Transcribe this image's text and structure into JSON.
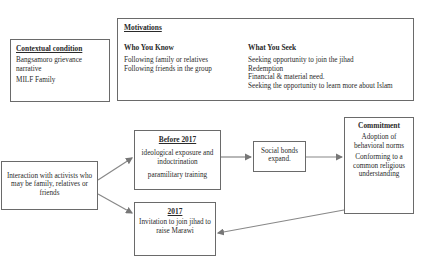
{
  "contextual": {
    "title": "Contextual condition",
    "items": [
      "Bangsamoro grievance narrative",
      "MILF Family"
    ]
  },
  "motivations": {
    "title": "Motivations",
    "who_you_know": {
      "heading": "Who You Know",
      "items": [
        "Following family or relatives",
        "Following friends in the group"
      ]
    },
    "what_you_seek": {
      "heading": "What You Seek",
      "items": [
        "Seeking opportunity to join the jihad",
        "Redemption",
        "Financial & material need.",
        "Seeking the opportunity to learn more about Islam"
      ]
    }
  },
  "interaction": {
    "text": "Interaction with activists who may be family, relatives or friends"
  },
  "before2017": {
    "title": "Before 2017",
    "items": [
      "ideological exposure and indoctrination",
      "paramilitary training"
    ]
  },
  "y2017": {
    "title": "2017",
    "text": "Invitation to join jihad to raise Marawi"
  },
  "social": {
    "text": "Social bonds expand."
  },
  "commitment": {
    "title": "Commitment",
    "items": [
      "Adoption of behavioral norms",
      "Conforming to a common religious understanding"
    ]
  },
  "edges": [
    {
      "from": "interaction",
      "to": "before2017"
    },
    {
      "from": "interaction",
      "to": "y2017"
    },
    {
      "from": "before2017",
      "to": "social"
    },
    {
      "from": "social",
      "to": "commitment"
    },
    {
      "from": "commitment",
      "to": "y2017"
    }
  ]
}
